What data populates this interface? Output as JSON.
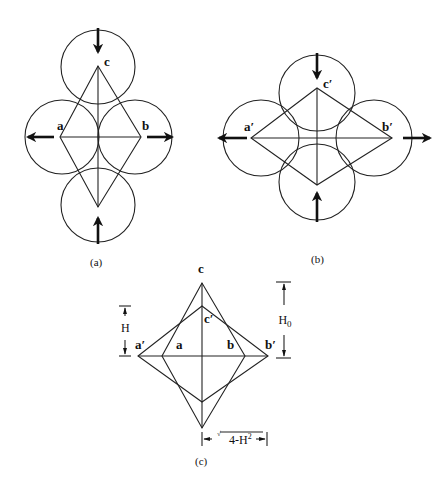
{
  "figure": {
    "panels": [
      {
        "id": "a",
        "caption": "(a)",
        "labels": {
          "top": "c",
          "left": "a",
          "right": "b"
        },
        "description": "Four circles in contact arranged around a rhombus a-c-b; arrows pull left/right and push top/bottom"
      },
      {
        "id": "b",
        "caption": "(b)",
        "labels": {
          "top": "c′",
          "left": "a′",
          "right": "b′"
        },
        "description": "Deformed arrangement: left/right circles moved outward, top/bottom circles moved inward forming a flatter rhombus"
      },
      {
        "id": "c",
        "caption": "(c)",
        "labels": {
          "outer_top": "c",
          "inner_top": "c′",
          "left_outer": "a′",
          "left_inner": "a",
          "right_inner": "b",
          "right_outer": "b′"
        },
        "dimensions": {
          "inner_height": "H",
          "outer_height": "H",
          "outer_height_sub": "0",
          "half_width_radical": "√",
          "half_width_expr": "4-H",
          "half_width_sup": "2"
        },
        "description": "Overlay of the original and deformed rhombi with dimension annotations"
      }
    ]
  }
}
